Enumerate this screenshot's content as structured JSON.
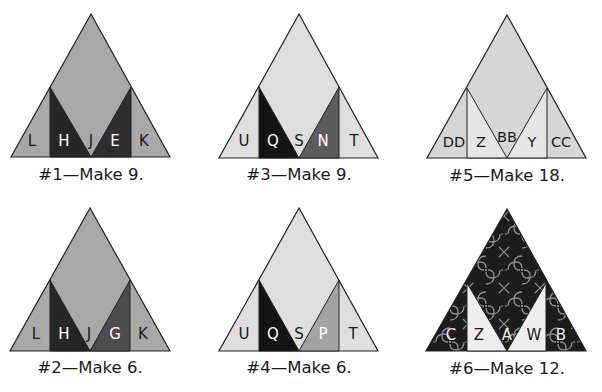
{
  "colors": {
    "medium_gray": "#a8a8a8",
    "light_gray": "#dedede",
    "dark": "#262626",
    "dark_gray": "#4c4c4c",
    "mid_dark_gray": "#5c5c5c",
    "pale_mid": "#a0a0a0",
    "pattern_dark": "#1c1c1c",
    "pattern_line": "#8a8a8a",
    "outline": "#222222"
  },
  "blocks": [
    {
      "id": 1,
      "caption": "#1—Make 9.",
      "labels": [
        "L",
        "H",
        "J",
        "E",
        "K"
      ]
    },
    {
      "id": 3,
      "caption": "#3—Make 9.",
      "labels": [
        "U",
        "Q",
        "S",
        "N",
        "T"
      ]
    },
    {
      "id": 5,
      "caption": "#5—Make 18.",
      "labels": [
        "DD",
        "Z",
        "BB",
        "Y",
        "CC"
      ]
    },
    {
      "id": 2,
      "caption": "#2—Make 6.",
      "labels": [
        "L",
        "H",
        "J",
        "G",
        "K"
      ]
    },
    {
      "id": 4,
      "caption": "#4—Make 6.",
      "labels": [
        "U",
        "Q",
        "S",
        "P",
        "T"
      ]
    },
    {
      "id": 6,
      "caption": "#6—Make 12.",
      "labels": [
        "C",
        "Z",
        "A",
        "W",
        "B"
      ]
    }
  ]
}
